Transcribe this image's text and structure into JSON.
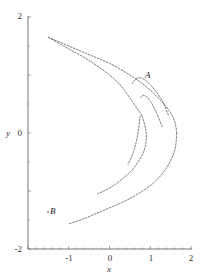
{
  "chart_data": {
    "type": "scatter",
    "title": "",
    "xlabel": "x",
    "ylabel": "y",
    "xlim": [
      -2,
      2
    ],
    "ylim": [
      -2,
      2
    ],
    "x_ticks": [
      "-2",
      "-1",
      "0",
      "1",
      "2"
    ],
    "y_ticks": [
      "-2",
      "0",
      "2"
    ],
    "grid": false,
    "legend": null,
    "annotations": [
      {
        "text": "A",
        "x": 0.8,
        "y": 1.0
      },
      {
        "text": "B",
        "x": -1.35,
        "y": -1.3
      }
    ],
    "series": [
      {
        "name": "attractor-outer-upper",
        "x": [
          -1.5,
          -1.0,
          -0.5,
          0.0,
          0.5,
          0.9,
          1.2,
          1.45,
          1.6,
          1.65
        ],
        "y": [
          1.65,
          1.5,
          1.35,
          1.2,
          1.0,
          0.8,
          0.6,
          0.4,
          0.2,
          0.0
        ]
      },
      {
        "name": "attractor-outer-lower",
        "x": [
          1.65,
          1.6,
          1.4,
          1.1,
          0.7,
          0.3,
          -0.2,
          -0.6,
          -1.0
        ],
        "y": [
          0.0,
          -0.3,
          -0.6,
          -0.85,
          -1.05,
          -1.2,
          -1.35,
          -1.47,
          -1.57
        ]
      },
      {
        "name": "attractor-inner-upper",
        "x": [
          -1.5,
          -1.0,
          -0.5,
          0.0,
          0.3,
          0.55,
          0.8
        ],
        "y": [
          1.65,
          1.45,
          1.25,
          1.0,
          0.8,
          0.55,
          0.3
        ]
      },
      {
        "name": "attractor-inner-lower",
        "x": [
          0.8,
          0.9,
          0.85,
          0.6,
          0.3,
          0.0,
          -0.3
        ],
        "y": [
          0.3,
          0.0,
          -0.3,
          -0.6,
          -0.8,
          -0.95,
          -1.05
        ]
      },
      {
        "name": "attractor-fold-a",
        "x": [
          0.55,
          0.7,
          0.9,
          1.1,
          1.3,
          1.45
        ],
        "y": [
          0.85,
          0.95,
          0.9,
          0.75,
          0.55,
          0.3
        ]
      },
      {
        "name": "attractor-fold-b",
        "x": [
          0.75,
          0.85,
          1.0,
          1.15,
          1.3
        ],
        "y": [
          0.6,
          0.65,
          0.55,
          0.35,
          0.1
        ]
      },
      {
        "name": "attractor-inner-stub",
        "x": [
          0.75,
          0.7,
          0.6,
          0.45
        ],
        "y": [
          0.3,
          0.0,
          -0.3,
          -0.55
        ]
      }
    ]
  }
}
